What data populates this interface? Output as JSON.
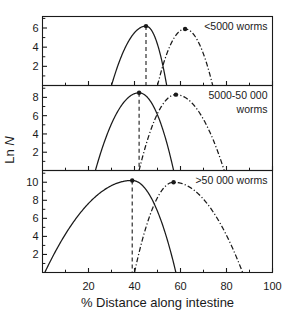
{
  "chart_data": {
    "type": "line",
    "title": "",
    "xlabel": "% Distance along intestine",
    "ylabel": "Ln N",
    "xlim": [
      0,
      100
    ],
    "xticks": [
      20,
      40,
      60,
      80,
      100
    ],
    "xticklabels": [
      "20",
      "40",
      "60",
      "80",
      "100"
    ],
    "grid": false,
    "legend_position": "none",
    "panels": [
      {
        "label": "<5000 worms",
        "label_lines": [
          "<5000 worms"
        ],
        "ylim": [
          0,
          7.2
        ],
        "yticks": [
          2,
          4,
          6
        ],
        "yticklabels": [
          "2",
          "4",
          "6"
        ],
        "series": [
          {
            "name": "solid-curve",
            "style": "solid",
            "peak_x": 45,
            "peak_y": 6.2,
            "x_start": 30,
            "x_end": 54,
            "marker": true,
            "dropline": true
          },
          {
            "name": "dash-dot-curve",
            "style": "dashdot",
            "peak_x": 62,
            "peak_y": 5.9,
            "x_start": 50,
            "x_end": 74,
            "marker": true,
            "dropline": false
          }
        ]
      },
      {
        "label": "5000-50 000 worms",
        "label_lines": [
          "5000-50 000",
          "worms"
        ],
        "ylim": [
          0,
          9.3
        ],
        "yticks": [
          2,
          4,
          6,
          8
        ],
        "yticklabels": [
          "2",
          "4",
          "6",
          "8"
        ],
        "series": [
          {
            "name": "solid-curve",
            "style": "solid",
            "peak_x": 42,
            "peak_y": 8.5,
            "x_start": 23,
            "x_end": 57,
            "marker": true,
            "dropline": true
          },
          {
            "name": "dash-dot-curve",
            "style": "dashdot",
            "peak_x": 58,
            "peak_y": 8.3,
            "x_start": 42,
            "x_end": 79,
            "marker": true,
            "dropline": false
          }
        ]
      },
      {
        "label": ">50 000 worms",
        "label_lines": [
          ">50 000 worms"
        ],
        "ylim": [
          0,
          11.3
        ],
        "yticks": [
          2,
          4,
          6,
          8,
          10
        ],
        "yticklabels": [
          "2",
          "4",
          "6",
          "8",
          "10"
        ],
        "series": [
          {
            "name": "solid-curve",
            "style": "solid",
            "peak_x": 39,
            "peak_y": 10.2,
            "x_start": 1,
            "x_end": 58,
            "marker": true,
            "dropline": true
          },
          {
            "name": "dash-dot-curve",
            "style": "dashdot",
            "peak_x": 57,
            "peak_y": 10.0,
            "x_start": 40,
            "x_end": 87,
            "marker": true,
            "dropline": false
          }
        ]
      }
    ]
  }
}
